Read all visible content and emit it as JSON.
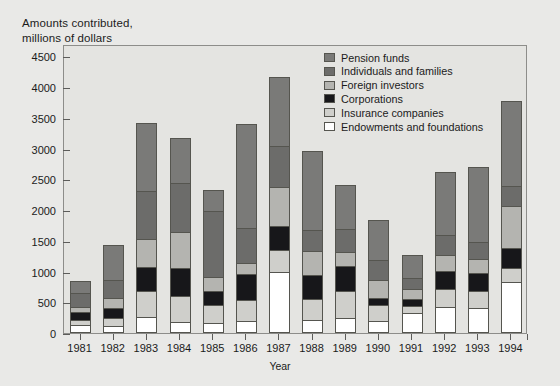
{
  "title": "Amounts contributed,\nmillions of dollars",
  "axis": {
    "x_title": "Year",
    "y_ticks": [
      0,
      500,
      1000,
      1500,
      2000,
      2500,
      3000,
      3500,
      4000,
      4500
    ]
  },
  "legend": {
    "items": [
      {
        "label": "Pension funds",
        "color": "#7a7a78"
      },
      {
        "label": "Individuals and families",
        "color": "#6c6c6a"
      },
      {
        "label": "Foreign investors",
        "color": "#b4b4b0"
      },
      {
        "label": "Corporations",
        "color": "#17171a"
      },
      {
        "label": "Insurance companies",
        "color": "#cfcfcb"
      },
      {
        "label": "Endowments and foundations",
        "color": "#ffffff"
      }
    ]
  },
  "chart_data": {
    "type": "bar",
    "title": "Amounts contributed, millions of dollars",
    "xlabel": "Year",
    "ylabel": "Amounts contributed, millions of dollars",
    "ylim": [
      0,
      4700
    ],
    "grid": false,
    "stacked": true,
    "legend_position": "top-right",
    "categories": [
      "1981",
      "1982",
      "1983",
      "1984",
      "1985",
      "1986",
      "1987",
      "1988",
      "1989",
      "1990",
      "1991",
      "1992",
      "1993",
      "1994"
    ],
    "series": [
      {
        "name": "Endowments and foundations",
        "color": "#ffffff",
        "values": [
          130,
          110,
          260,
          180,
          170,
          200,
          990,
          210,
          250,
          200,
          320,
          430,
          400,
          830
        ]
      },
      {
        "name": "Insurance companies",
        "color": "#cfcfcb",
        "values": [
          80,
          130,
          420,
          420,
          290,
          330,
          360,
          340,
          430,
          250,
          120,
          290,
          290,
          220
        ]
      },
      {
        "name": "Corporations",
        "color": "#17171a",
        "values": [
          130,
          160,
          400,
          450,
          220,
          430,
          390,
          400,
          410,
          120,
          120,
          290,
          280,
          330
        ]
      },
      {
        "name": "Foreign investors",
        "color": "#b4b4b0",
        "values": [
          80,
          170,
          450,
          590,
          230,
          180,
          640,
          380,
          230,
          300,
          150,
          260,
          240,
          680
        ]
      },
      {
        "name": "Individuals and families",
        "color": "#6c6c6a",
        "values": [
          230,
          300,
          780,
          800,
          1080,
          570,
          660,
          340,
          370,
          310,
          180,
          320,
          270,
          330
        ]
      },
      {
        "name": "Pension funds",
        "color": "#7a7a78",
        "values": [
          200,
          560,
          1110,
          730,
          340,
          1690,
          1120,
          1290,
          720,
          660,
          380,
          1030,
          1220,
          1380
        ]
      }
    ],
    "totals": [
      850,
      1430,
      3420,
      3170,
      2330,
      3400,
      4160,
      2960,
      2410,
      1840,
      1270,
      2620,
      2700,
      3770
    ]
  }
}
